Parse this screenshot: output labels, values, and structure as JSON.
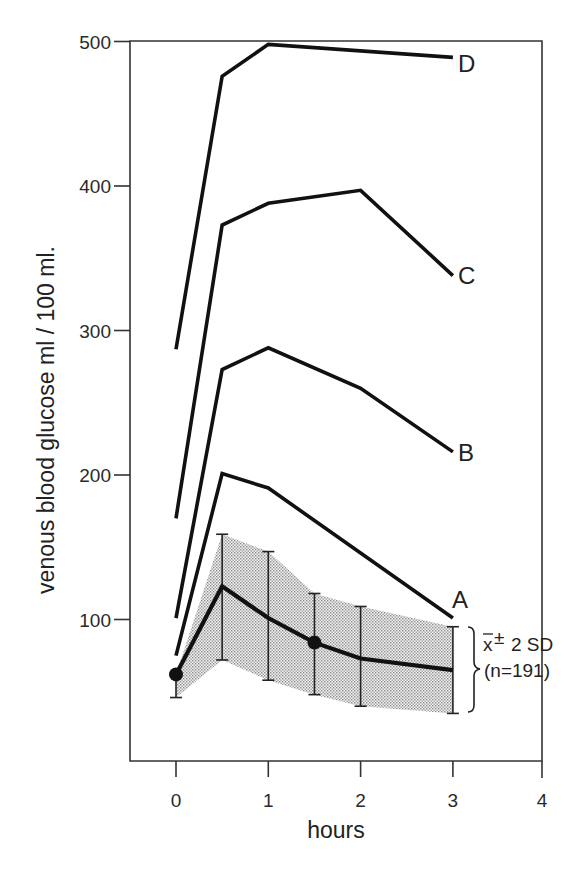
{
  "chart_data": {
    "type": "line",
    "title": "",
    "xlabel": "hours",
    "ylabel": "venous blood glucose  ml / 100 ml.",
    "xlim": [
      -0.5,
      4
    ],
    "ylim": [
      0,
      500
    ],
    "x_ticks": [
      0,
      1,
      2,
      3,
      4
    ],
    "y_ticks": [
      100,
      200,
      300,
      400,
      500
    ],
    "grid": false,
    "frame": "box",
    "series": [
      {
        "name": "D",
        "x": [
          0,
          0.5,
          1,
          3
        ],
        "values": [
          287,
          476,
          498,
          489
        ]
      },
      {
        "name": "C",
        "x": [
          0,
          0.5,
          1,
          2,
          3
        ],
        "values": [
          170,
          373,
          388,
          397,
          338
        ]
      },
      {
        "name": "B",
        "x": [
          0,
          0.5,
          1,
          2,
          3
        ],
        "values": [
          101,
          273,
          288,
          260,
          216
        ]
      },
      {
        "name": "A",
        "x": [
          0,
          0.5,
          1,
          3
        ],
        "values": [
          75,
          201,
          191,
          101
        ]
      },
      {
        "name": "mean (x̄ ± 2 SD, n=191)",
        "x": [
          0,
          0.5,
          1,
          1.5,
          2,
          3
        ],
        "values": [
          62,
          123,
          101,
          84,
          73,
          65
        ],
        "upper": [
          62,
          159,
          147,
          118,
          109,
          95
        ],
        "lower": [
          46,
          72,
          58,
          48,
          40,
          35
        ],
        "markers": [
          0,
          3
        ]
      }
    ],
    "annotations": [
      {
        "text_main": "x̄",
        "text_pm": "±",
        "text_sd": "2 SD",
        "text_n": "(n=191)",
        "position": "right of t=3 error bar, bracketed"
      }
    ]
  },
  "labels": {
    "y_title": "venous blood glucose  ml / 100 ml.",
    "x_title": "hours",
    "y_ticks": [
      "100",
      "200",
      "300",
      "400",
      "500"
    ],
    "x_ticks": [
      "0",
      "1",
      "2",
      "3",
      "4"
    ],
    "curve_D": "D",
    "curve_C": "C",
    "curve_B": "B",
    "curve_A": "A",
    "legend_line1_x": "x",
    "legend_line1_pm": "±",
    "legend_line1_sd": "2 SD",
    "legend_line2": "(n=191)"
  }
}
